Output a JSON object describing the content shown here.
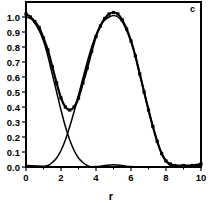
{
  "chart_data": {
    "type": "line",
    "title": "",
    "panel_label": "c",
    "xlabel": "r",
    "ylabel": "",
    "xlim": [
      0,
      10
    ],
    "ylim": [
      0,
      1.1
    ],
    "grid": false,
    "legend": null,
    "x_ticks": [
      0,
      2,
      4,
      6,
      8,
      10
    ],
    "x_tick_labels": [
      "0",
      "2",
      "4",
      "6",
      "8",
      "10"
    ],
    "y_ticks": [
      0.0,
      0.1,
      0.2,
      0.3,
      0.4,
      0.5,
      0.6,
      0.7,
      0.8,
      0.9,
      1.0
    ],
    "y_tick_labels": [
      "0.0",
      "0.1",
      "0.2",
      "0.3",
      "0.4",
      "0.5",
      "0.6",
      "0.7",
      "0.8",
      "0.9",
      "1.0"
    ],
    "series": [
      {
        "name": "total (with markers)",
        "markers": true,
        "x": [
          0,
          0.25,
          0.5,
          0.75,
          1.0,
          1.25,
          1.5,
          1.75,
          2.0,
          2.25,
          2.5,
          2.75,
          3.0,
          3.25,
          3.5,
          3.75,
          4.0,
          4.25,
          4.5,
          4.75,
          5.0,
          5.25,
          5.5,
          5.75,
          6.0,
          6.25,
          6.5,
          6.75,
          7.0,
          7.25,
          7.5,
          7.75,
          8.0,
          8.25,
          8.5,
          9.0,
          9.5,
          10.0
        ],
        "y": [
          1.02,
          1.0,
          0.97,
          0.93,
          0.86,
          0.78,
          0.67,
          0.56,
          0.46,
          0.4,
          0.38,
          0.4,
          0.46,
          0.56,
          0.66,
          0.77,
          0.87,
          0.94,
          0.99,
          1.02,
          1.03,
          1.02,
          0.98,
          0.92,
          0.84,
          0.74,
          0.62,
          0.5,
          0.38,
          0.27,
          0.17,
          0.09,
          0.04,
          0.02,
          0.01,
          0.01,
          0.01,
          0.02
        ]
      },
      {
        "name": "component 1",
        "markers": false,
        "x": [
          0,
          0.25,
          0.5,
          0.75,
          1.0,
          1.25,
          1.5,
          1.75,
          2.0,
          2.25,
          2.5,
          2.75,
          3.0,
          3.25,
          3.5,
          3.75,
          4.0
        ],
        "y": [
          1.0,
          0.99,
          0.96,
          0.91,
          0.84,
          0.74,
          0.62,
          0.5,
          0.38,
          0.27,
          0.18,
          0.11,
          0.06,
          0.03,
          0.01,
          0.0,
          0.0
        ]
      },
      {
        "name": "component 2",
        "markers": false,
        "x": [
          1.0,
          1.25,
          1.5,
          1.75,
          2.0,
          2.25,
          2.5,
          2.75,
          3.0,
          3.25,
          3.5,
          3.75,
          4.0,
          4.25,
          4.5,
          4.75,
          5.0,
          5.25,
          5.5,
          5.75,
          6.0,
          6.25,
          6.5,
          6.75,
          7.0,
          7.25,
          7.5,
          7.75,
          8.0,
          8.25,
          8.5
        ],
        "y": [
          0.0,
          0.01,
          0.03,
          0.06,
          0.11,
          0.18,
          0.27,
          0.37,
          0.48,
          0.59,
          0.7,
          0.8,
          0.88,
          0.94,
          0.98,
          1.0,
          1.01,
          1.0,
          0.97,
          0.91,
          0.84,
          0.74,
          0.62,
          0.5,
          0.38,
          0.27,
          0.17,
          0.09,
          0.04,
          0.01,
          0.0
        ]
      },
      {
        "name": "baseline residual",
        "markers": false,
        "x": [
          0,
          1,
          2,
          3,
          4,
          4.5,
          5.0,
          5.5,
          6.0,
          7.0,
          8.0,
          9.0,
          10.0
        ],
        "y": [
          0.01,
          0.005,
          0.0,
          0.0,
          0.003,
          0.01,
          0.015,
          0.01,
          0.003,
          0.0,
          0.0,
          0.005,
          0.01
        ]
      }
    ]
  }
}
